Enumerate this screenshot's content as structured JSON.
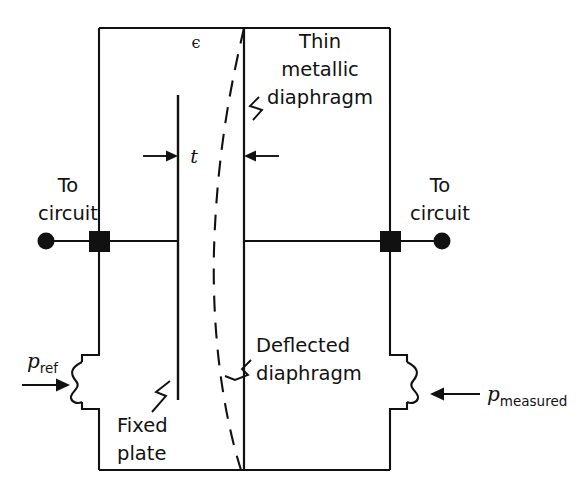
{
  "figure": {
    "background_color": "#ffffff",
    "line_color": "#111111"
  },
  "labels": {
    "permittivity_symbol": "ϵ",
    "thickness_symbol": "t",
    "thin_metallic_diaphragm": {
      "line1": "Thin",
      "line2": "metallic",
      "line3": "diaphragm"
    },
    "deflected_diaphragm": {
      "line1": "Deflected",
      "line2": "diaphragm"
    },
    "fixed_plate": {
      "line1": "Fixed",
      "line2": "plate"
    },
    "to_circuit_left": {
      "line1": "To",
      "line2": "circuit"
    },
    "to_circuit_right": {
      "line1": "To",
      "line2": "circuit"
    },
    "pressure_reference": {
      "base": "p",
      "subscript": "ref"
    },
    "pressure_measured": {
      "base": "p",
      "subscript": "measured"
    }
  },
  "geometry": {
    "body_left_x": 99,
    "body_right_x": 390,
    "body_top_y": 28,
    "body_bottom_y": 470,
    "fixed_plate_x": 178,
    "diaphragm_x": 244,
    "circuit_line_y": 241,
    "left_terminal_dot_x": 46,
    "right_terminal_dot_x": 442,
    "bellows_top_y": 360,
    "bellows_bottom_y": 404
  },
  "icons": {
    "terminal_dot_left": "filled-circle",
    "terminal_dot_right": "filled-circle",
    "terminal_square_left": "filled-square",
    "terminal_square_right": "filled-square",
    "pressure_arrow_left": "arrow-right",
    "pressure_arrow_right": "arrow-left",
    "thickness_arrow_left": "arrow-right",
    "thickness_arrow_right": "arrow-left"
  }
}
